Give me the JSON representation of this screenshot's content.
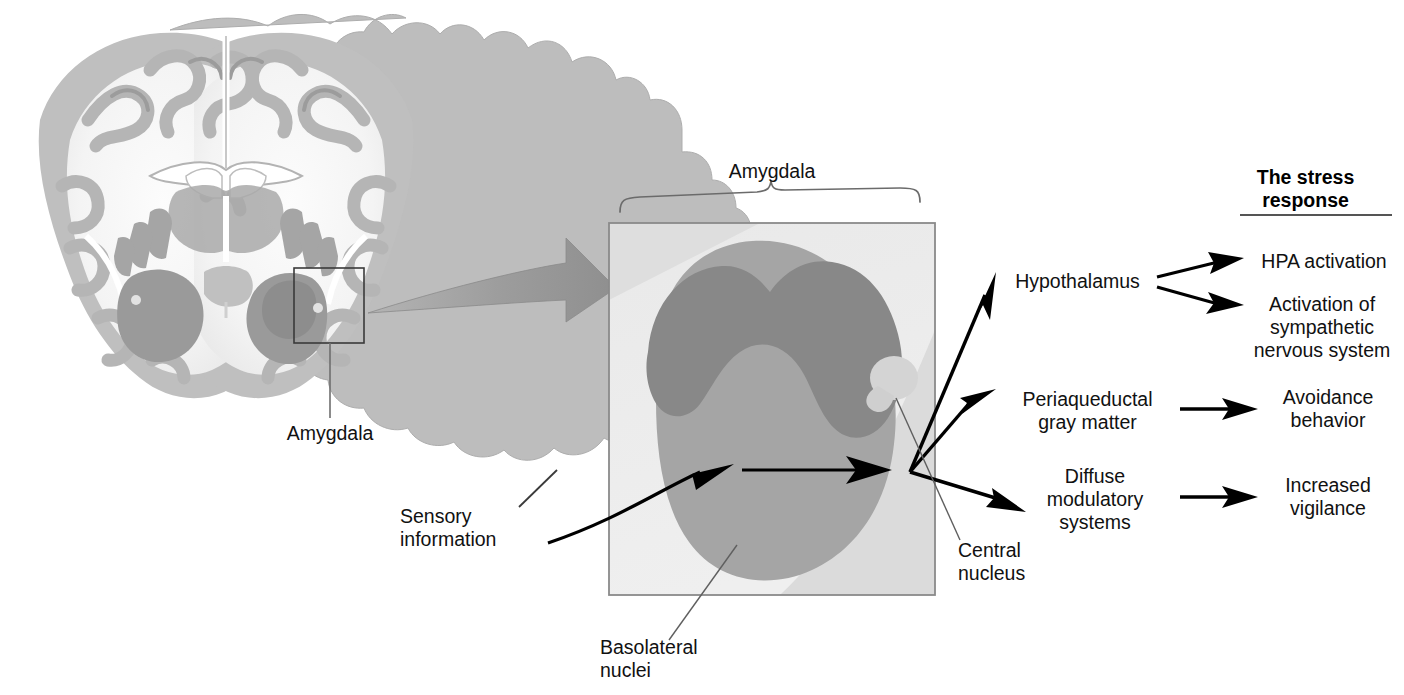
{
  "figure": {
    "kind": "neuroanatomy-diagram",
    "title_block": {
      "header_line1": "The stress",
      "header_line2": "response"
    },
    "brain_section": {
      "label": "Amygdala",
      "inset_box_note": "boxed region on right amygdala"
    },
    "inset": {
      "bracket_label": "Amygdala",
      "regions": [
        {
          "name": "Basolateral nuclei",
          "label": "Basolateral\nnuclei"
        },
        {
          "name": "Central nucleus",
          "label": "Central\nnucleus"
        }
      ],
      "input_label": "Sensory\ninformation"
    },
    "targets": [
      {
        "id": "hypothalamus",
        "label": "Hypothalamus"
      },
      {
        "id": "pag",
        "label": "Periaqueductal\ngray matter"
      },
      {
        "id": "diffuse",
        "label": "Diffuse\nmodulatory\nsystems"
      }
    ],
    "outcomes": [
      {
        "id": "hpa",
        "label": "HPA activation"
      },
      {
        "id": "sns",
        "label": "Activation of\nsympathetic\nnervous system"
      },
      {
        "id": "avoid",
        "label": "Avoidance\nbehavior"
      },
      {
        "id": "vigilance",
        "label": "Increased\nvigilance"
      }
    ],
    "colors": {
      "background": "#ffffff",
      "ink": "#111111",
      "box_border": "#8a8a8a",
      "inset_background": "#ededed",
      "basolateral": "#a8a8a8",
      "cortical_band": "#8c8c8c",
      "central_nucleus": "#d2d2d2",
      "pale_wedge": "#e3e3e3",
      "big_arrow": "#9a9a9a",
      "leader_line": "#6e6e6e",
      "gray_matter": "#b9b9b9",
      "white_matter": "#f2f2f2",
      "deep_nuclei": "#9d9d9d"
    }
  }
}
